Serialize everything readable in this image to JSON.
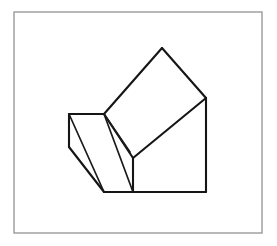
{
  "page": {
    "background_color": "#ffffff",
    "width": 277,
    "height": 246
  },
  "frame": {
    "name": "outer-border",
    "x": 14,
    "y": 12,
    "width": 248,
    "height": 221,
    "stroke_color": "#9a9a9a",
    "stroke_width": 1.4,
    "fill_color": "#ffffff"
  },
  "figure": {
    "caption": "Line drawing of a composite polyhedron: an inclined rectangular slab resting on a wedge-shaped block",
    "stroke_color": "#151515",
    "fill_color": "#ffffff",
    "stroke_width": 2.1,
    "vertices": {
      "apex_top": [
        162,
        48
      ],
      "right_upper": [
        206,
        98
      ],
      "right_bottom": [
        206,
        192
      ],
      "slab_left_upper": [
        104,
        114
      ],
      "slab_mid_front": [
        133,
        158
      ],
      "wedge_left_top": [
        69,
        114
      ],
      "wedge_left_bottom": [
        69,
        147
      ],
      "wedge_bottom_left": [
        104,
        192
      ],
      "bottom_mid": [
        133,
        192
      ],
      "inner_fold": [
        130,
        152
      ]
    },
    "faces": [
      {
        "name": "slab-top-face",
        "points": "162,48 206,98 133,158 104,114"
      },
      {
        "name": "slab-right-face",
        "points": "206,98 206,192 133,192 133,158"
      },
      {
        "name": "wedge-top-face",
        "points": "69,114 104,114 133,158 104,192"
      },
      {
        "name": "wedge-left-face",
        "points": "69,114 69,147 104,192"
      }
    ],
    "edges": [
      {
        "name": "slab-top-left-edge",
        "points": "104,114 162,48"
      },
      {
        "name": "slab-top-right-edge",
        "points": "162,48 206,98"
      },
      {
        "name": "slab-front-right-edge",
        "points": "206,98 133,158"
      },
      {
        "name": "slab-front-left-edge",
        "points": "133,158 104,114"
      },
      {
        "name": "right-vertical-edge",
        "points": "206,98 206,192"
      },
      {
        "name": "bottom-right-edge",
        "points": "133,192 206,192"
      },
      {
        "name": "slab-front-vertical-edge",
        "points": "133,158 133,192"
      },
      {
        "name": "wedge-top-edge",
        "points": "69,114 104,114"
      },
      {
        "name": "wedge-left-vertical-edge",
        "points": "69,114 69,147"
      },
      {
        "name": "wedge-lower-left-edge",
        "points": "69,147 104,192"
      },
      {
        "name": "wedge-bottom-edge",
        "points": "104,192 133,192"
      },
      {
        "name": "wedge-diagonal-edge",
        "points": "69,114 104,192"
      },
      {
        "name": "wedge-inner-fold-edge",
        "points": "104,114 133,192"
      },
      {
        "name": "wedge-crease-edge",
        "points": "104,114 130,152"
      }
    ]
  }
}
